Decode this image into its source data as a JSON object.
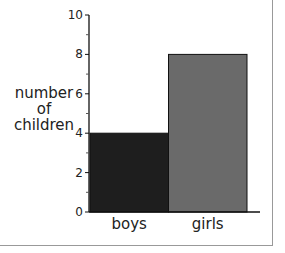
{
  "chart_data": {
    "type": "bar",
    "title": "",
    "xlabel": "",
    "ylabel": "number of children",
    "ylabel_lines": [
      "number",
      "of",
      "children"
    ],
    "categories": [
      "boys",
      "girls"
    ],
    "values": [
      4,
      8
    ],
    "colors": [
      "#1e1e1e",
      "#6a6a6a"
    ],
    "ylim": [
      0,
      10
    ],
    "y_ticks": [
      0,
      2,
      4,
      6,
      8,
      10
    ],
    "y_minor_ticks": [
      1,
      3,
      5,
      7,
      9
    ],
    "grid": false,
    "legend": null
  }
}
